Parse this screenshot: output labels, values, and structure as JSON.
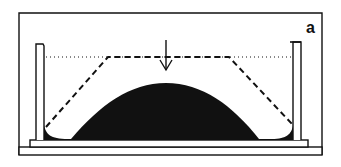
{
  "figure": {
    "panel_label": "a",
    "elements": {
      "outer_frame": "rectangular container outline",
      "base_plate": "horizontal base slab",
      "inner_plate": "raised support plate",
      "left_wall": "vertical left barrier",
      "right_wall": "vertical right barrier",
      "reference_line": "dotted horizontal level line",
      "dashed_profile": "dashed trapezoidal profile",
      "arrow": "downward pointing arrow",
      "dome": "solid black dome-shaped mass"
    },
    "colors": {
      "ink": "#111111",
      "background": "#ffffff"
    }
  }
}
